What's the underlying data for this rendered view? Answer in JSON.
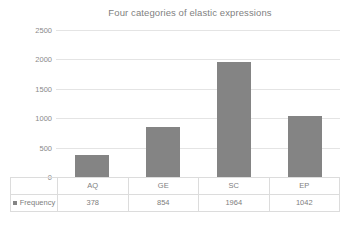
{
  "chart_data": {
    "type": "bar",
    "title": "Four categories of elastic expressions",
    "categories": [
      "AQ",
      "GE",
      "SC",
      "EP"
    ],
    "values": [
      378,
      854,
      1964,
      1042
    ],
    "series": [
      {
        "name": "Frequency",
        "values": [
          378,
          854,
          1964,
          1042
        ]
      }
    ],
    "xlabel": "",
    "ylabel": "",
    "ylim": [
      0,
      2500
    ],
    "ytick_labels": [
      "2500",
      "2000",
      "1500",
      "1000",
      "500",
      "0"
    ],
    "ytick_values": [
      2500,
      2000,
      1500,
      1000,
      500,
      0
    ],
    "grid": true,
    "legend_position": "data-table-left",
    "bar_color": "#848484",
    "gridline_color": "#e4e4e4",
    "title_color": "#7f7f7f",
    "text_color": "#7e7e7e",
    "data_table": {
      "header_row": [
        "AQ",
        "GE",
        "SC",
        "EP"
      ],
      "series_label": "Frequency",
      "value_row": [
        "378",
        "854",
        "1964",
        "1042"
      ]
    }
  }
}
